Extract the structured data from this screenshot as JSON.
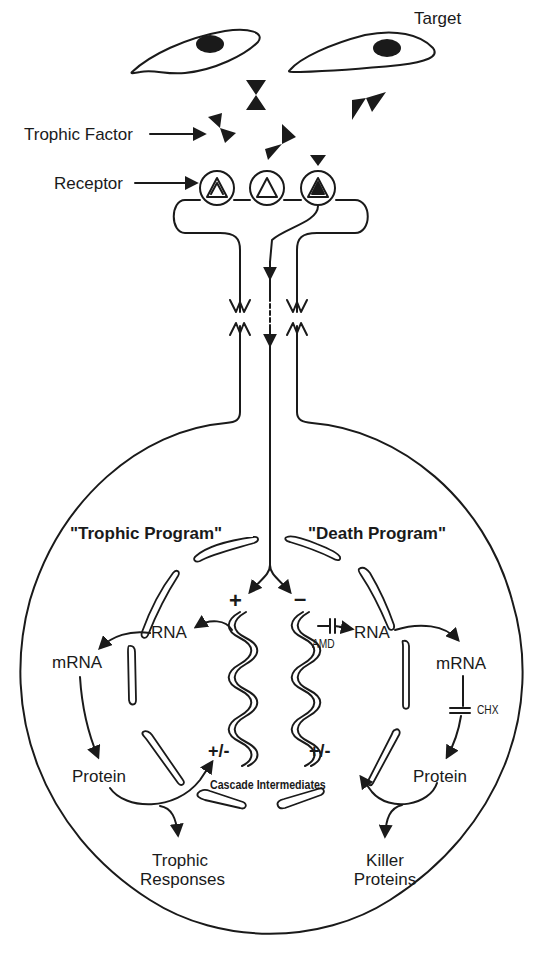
{
  "figure": {
    "labels": {
      "target": "Target",
      "trophic_factor": "Trophic Factor",
      "receptor": "Receptor",
      "trophic_program": "\"Trophic Program\"",
      "death_program": "\"Death Program\"",
      "plus": "+",
      "minus": "–",
      "left_rna": "RNA",
      "left_mrna": "mRNA",
      "left_protein": "Protein",
      "left_pm": "+/-",
      "right_rna": "RNA",
      "right_mrna": "mRNA",
      "right_protein": "Protein",
      "right_pm": "+/-",
      "amd": "AMD",
      "chx": "CHX",
      "cascade": "Cascade Intermediates",
      "trophic_responses_1": "Trophic",
      "trophic_responses_2": "Responses",
      "killer_proteins_1": "Killer",
      "killer_proteins_2": "Proteins"
    },
    "colors": {
      "ink": "#1a1a1a",
      "background": "#ffffff"
    }
  }
}
